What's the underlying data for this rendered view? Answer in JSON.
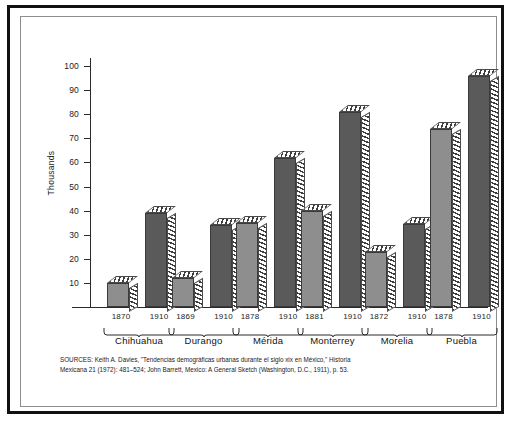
{
  "figure": {
    "y_axis_title": "Thousands",
    "source_note_line1": "SOURCES: Keith A. Davies, \"Tendencias demográficas urbanas durante el siglo xix en México,\" Historia",
    "source_note_line2": "Mexicana 21 (1972): 481–524; John Barrett, Mexico: A General Sketch (Washington, D.C., 1911), p. 53."
  },
  "chart_data": {
    "type": "bar",
    "title": "",
    "xlabel": "",
    "ylabel": "Thousands",
    "ylim": [
      0,
      100
    ],
    "yticks": [
      10,
      20,
      30,
      40,
      50,
      60,
      70,
      80,
      90,
      100
    ],
    "ytick_labels": [
      "10",
      "20",
      "30",
      "40",
      "50",
      "60",
      "70",
      "80",
      "90",
      "100"
    ],
    "grid": false,
    "legend": "none",
    "categories": [
      "Chihuahua",
      "Durango",
      "Mérida",
      "Monterrey",
      "Morelia",
      "Puebla"
    ],
    "series": [
      {
        "name": "Earlier year",
        "style": "light-gray",
        "color": "#8e8e8e",
        "x_labels": [
          "1870",
          "1869",
          "1878",
          "1881",
          "1872",
          "1878"
        ],
        "values": [
          10,
          12,
          35,
          40,
          23,
          74
        ]
      },
      {
        "name": "1910",
        "style": "dark-gray",
        "color": "#5a5a5a",
        "x_labels": [
          "1910",
          "1910",
          "1910",
          "1910",
          "1910",
          "1910"
        ],
        "values": [
          39,
          34,
          62,
          81,
          34.5,
          96
        ]
      }
    ],
    "bars": [
      {
        "group": "Chihuahua",
        "year": "1870",
        "value": 10,
        "shade": "light"
      },
      {
        "group": "Chihuahua",
        "year": "1910",
        "value": 39,
        "shade": "dark"
      },
      {
        "group": "Durango",
        "year": "1869",
        "value": 12,
        "shade": "light"
      },
      {
        "group": "Durango",
        "year": "1910",
        "value": 34,
        "shade": "dark"
      },
      {
        "group": "Mérida",
        "year": "1878",
        "value": 35,
        "shade": "light"
      },
      {
        "group": "Mérida",
        "year": "1910",
        "value": 62,
        "shade": "dark"
      },
      {
        "group": "Monterrey",
        "year": "1881",
        "value": 40,
        "shade": "light"
      },
      {
        "group": "Monterrey",
        "year": "1910",
        "value": 81,
        "shade": "dark"
      },
      {
        "group": "Morelia",
        "year": "1872",
        "value": 23,
        "shade": "light"
      },
      {
        "group": "Morelia",
        "year": "1910",
        "value": 34.5,
        "shade": "dark"
      },
      {
        "group": "Puebla",
        "year": "1878",
        "value": 74,
        "shade": "light"
      },
      {
        "group": "Puebla",
        "year": "1910",
        "value": 96,
        "shade": "dark"
      }
    ]
  }
}
